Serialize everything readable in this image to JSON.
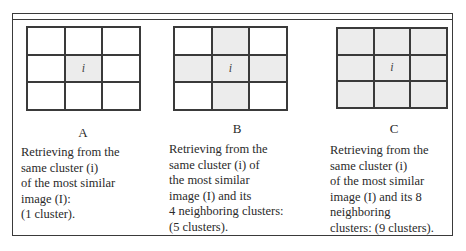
{
  "panels": [
    {
      "letter": "A",
      "center_label": "i",
      "shaded_cells": [
        4
      ],
      "description": "Retrieving from the\nsame cluster (i)\nof the most similar\nimage (I):\n(1 cluster)."
    },
    {
      "letter": "B",
      "center_label": "i",
      "shaded_cells": [
        1,
        3,
        4,
        5,
        7
      ],
      "description": "Retrieving from the\nsame cluster (i) of\nthe most similar\nimage (I) and its\n4 neighboring clusters:\n(5 clusters)."
    },
    {
      "letter": "C",
      "center_label": "i",
      "shaded_cells": [
        0,
        1,
        2,
        3,
        4,
        5,
        6,
        7,
        8
      ],
      "description": "Retrieving from the\nsame cluster (i)\nof the most similar\nimage (I) and its 8\nneighboring\nclusters: (9 clusters)."
    }
  ],
  "colors": {
    "line": "#3a3a3a",
    "shaded": "#ececec",
    "unshaded": "#ffffff"
  }
}
